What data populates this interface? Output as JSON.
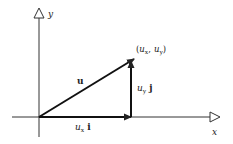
{
  "diagram": {
    "type": "vector-components",
    "axes": {
      "x_label": "x",
      "y_label": "y"
    },
    "point_label": {
      "open": "(",
      "ux": "u",
      "ux_sub": "x",
      "sep": ",",
      "uy": "u",
      "uy_sub": "y",
      "close": ")"
    },
    "vector_label": "u",
    "x_component": {
      "sym": "u",
      "sub": "x",
      "unit": "i"
    },
    "y_component": {
      "sym": "u",
      "sub": "y",
      "unit": "j"
    },
    "colors": {
      "ink": "#222222",
      "background": "#ffffff"
    }
  }
}
